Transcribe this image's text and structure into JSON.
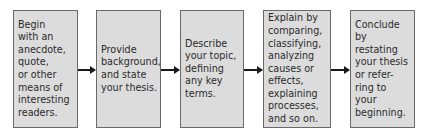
{
  "diagram": {
    "type": "flowchart",
    "colors": {
      "box_fill": "#dcdcdc",
      "box_border": "#6a6a6a",
      "text": "#2a2a2a",
      "arrow": "#1a1a1a"
    },
    "steps": [
      {
        "text": "Begin\nwith an\nanecdote,\nquote,\nor other\nmeans of\ninteresting\nreaders."
      },
      {
        "text": "Provide\nbackground,\nand state\nyour thesis."
      },
      {
        "text": "Describe\nyour topic,\ndefining\nany key\nterms."
      },
      {
        "text": "Explain by\ncomparing,\nclassifying,\nanalyzing\ncauses or\neffects,\nexplaining\nprocesses,\nand so on."
      },
      {
        "text": "Conclude\nby restating\nyour thesis\nor refer-\nring to your\nbeginning."
      }
    ]
  }
}
